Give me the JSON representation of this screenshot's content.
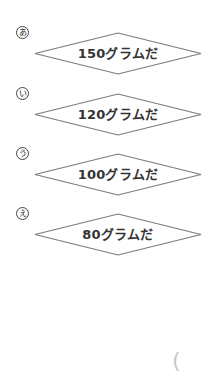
{
  "options": [
    {
      "marker": "あ",
      "label": "150グラムだ"
    },
    {
      "marker": "い",
      "label": "120グラムだ"
    },
    {
      "marker": "う",
      "label": "100グラムだ"
    },
    {
      "marker": "え",
      "label": "80グラムだ"
    }
  ],
  "answer_bracket": {
    "glyph": "("
  },
  "colors": {
    "diamond_stroke": "#7a7a7a",
    "label_text": "#333333",
    "bracket": "#c8c8c8"
  }
}
